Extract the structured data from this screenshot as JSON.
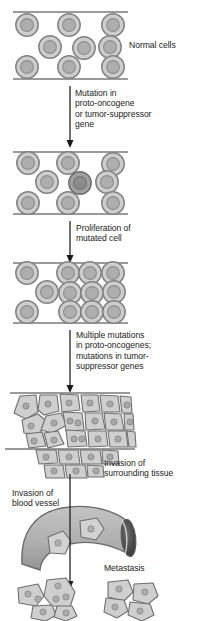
{
  "figure": {
    "type": "biological-process-diagram"
  },
  "palette": {
    "cell_fill": "#c9c9c9",
    "cell_fill_light": "#d6d6d6",
    "cell_stroke": "#7d7d7d",
    "nucleus_fill": "#ababab",
    "nucleus_stroke": "#8a8a8a",
    "mutated_cell_fill": "#a3a3a3",
    "mutated_nucleus_fill": "#8f8f8f",
    "membrane_line": "#9a9a9a",
    "tumor_cell_fill": "#cfcfcf",
    "tumor_cell_stroke": "#6f6f6f",
    "vessel_fill": "#b4b4b4",
    "vessel_stroke": "#6a6a6a",
    "vessel_lumen": "#4a4a4a",
    "arrow_color": "#1a1a1a",
    "text_color": "#1c1c1c",
    "background": "#ffffff"
  },
  "labels": {
    "normal_cells": "Normal cells",
    "mutation": "Mutation in\nproto-oncogene\nor tumor-suppressor\ngene",
    "proliferation": "Proliferation of\nmutated cell",
    "multiple_mutations": "Multiple mutations\nin proto-oncogenes;\nmutations in tumor-\nsuppressor genes",
    "invasion_tissue": "Invasion of\nsurrounding tissue",
    "invasion_vessel": "Invasion of\nblood vessel",
    "metastasis": "Metastasis"
  },
  "stages": [
    {
      "id": "stage-normal-epithelium",
      "name": "Normal epithelium",
      "label": "Normal cells",
      "cell_count": 9,
      "mutated_count": 0,
      "description": "Orderly monolayer of normal cells bounded by basement membrane lines"
    },
    {
      "id": "stage-single-mutation",
      "name": "Single mutated cell",
      "label": "Mutation in proto-oncogene or tumor-suppressor gene",
      "cell_count": 9,
      "mutated_count": 1,
      "description": "One cell acquires a mutation and is shaded darker"
    },
    {
      "id": "stage-proliferation",
      "name": "Clonal proliferation",
      "label": "Proliferation of mutated cell",
      "cell_count": 12,
      "mutated_count": 12,
      "description": "Mutated cell divides producing a crowded clone"
    },
    {
      "id": "stage-invasion",
      "name": "Invasive tumor",
      "label": "Invasion of surrounding tissue",
      "cell_count": 27,
      "description": "Irregular polygonal tumor cells breach the basement membrane"
    },
    {
      "id": "stage-intravasation",
      "name": "Blood vessel invasion",
      "label": "Invasion of blood vessel",
      "cell_count": 2,
      "description": "Tumor cells enter a curved blood vessel with open lumen"
    },
    {
      "id": "stage-metastasis",
      "name": "Metastasis",
      "label": "Metastasis",
      "cluster_count": 2,
      "cells_left_cluster": 6,
      "cells_right_cluster": 5,
      "description": "Tumor cells form distant colonies"
    }
  ],
  "arrows": [
    {
      "name": "arrow-mutation",
      "from_stage": "stage-normal-epithelium",
      "to_stage": "stage-single-mutation"
    },
    {
      "name": "arrow-proliferation",
      "from_stage": "stage-single-mutation",
      "to_stage": "stage-proliferation"
    },
    {
      "name": "arrow-multiple-mutations",
      "from_stage": "stage-proliferation",
      "to_stage": "stage-invasion"
    },
    {
      "name": "arrow-metastasis",
      "from_stage": "stage-intravasation",
      "to_stage": "stage-metastasis"
    }
  ]
}
